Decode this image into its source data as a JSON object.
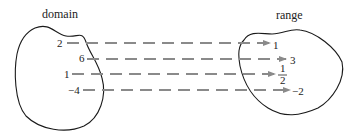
{
  "diagram": {
    "domain_label": "domain",
    "range_label": "range",
    "mappings": [
      {
        "from": "2",
        "to": "1"
      },
      {
        "from": "6",
        "to": "3"
      },
      {
        "from": "1",
        "to": "1/2",
        "to_num": "1",
        "to_den": "2"
      },
      {
        "from": "−4",
        "to": "−2"
      }
    ],
    "colors": {
      "arrow": "#8a8a8a",
      "outline": "#1a1a1a",
      "text": "#222222"
    }
  }
}
